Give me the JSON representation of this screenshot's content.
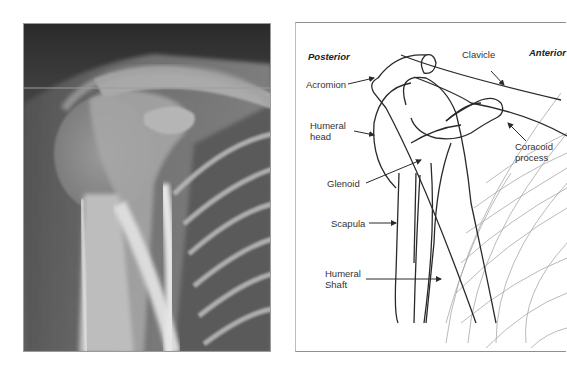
{
  "xray": {
    "description": "Shoulder radiograph (AP view)",
    "colors": {
      "background_dark": "#2b2b2b",
      "soft_tissue": "#6e6e6e",
      "bone": "#d8d8d8"
    }
  },
  "diagram": {
    "orientation": {
      "left": "Posterior",
      "right": "Anterior"
    },
    "labels": {
      "clavicle": "Clavicle",
      "acromion": "Acromion",
      "humeral_head_1": "Humeral",
      "humeral_head_2": "head",
      "coracoid_1": "Coracoid",
      "coracoid_2": "process",
      "glenoid": "Glenoid",
      "scapula": "Scapula",
      "humeral_shaft_1": "Humeral",
      "humeral_shaft_2": "Shaft"
    },
    "colors": {
      "outline": "#2a2a2a",
      "ribs": "#a8a8a8",
      "text": "#333333"
    }
  }
}
